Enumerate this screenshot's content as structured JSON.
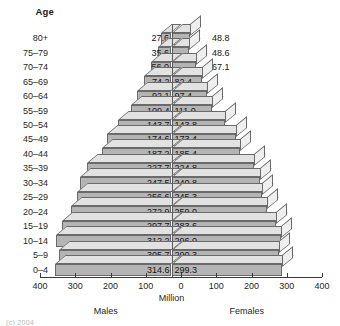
{
  "chart_data": {
    "type": "bar",
    "subtype": "population-pyramid",
    "title": "",
    "xlabel": "Million",
    "ylabel": "Age",
    "xlim": [
      -400,
      400
    ],
    "xticks": [
      400,
      300,
      200,
      100,
      0,
      100,
      200,
      300,
      400
    ],
    "grid": false,
    "categories": [
      "0–4",
      "5–9",
      "10–14",
      "15–19",
      "20–24",
      "25–29",
      "30–34",
      "35–39",
      "40–44",
      "45–49",
      "50–54",
      "55–59",
      "60–64",
      "65–69",
      "70–74",
      "75–79",
      "80+"
    ],
    "series": [
      {
        "name": "Males",
        "side": "left",
        "values": [
          314.6,
          305.7,
          312.2,
          297.7,
          272.9,
          256.6,
          247.5,
          227.7,
          187.2,
          174.6,
          143.7,
          109.4,
          92.1,
          74.2,
          56.0,
          35.6,
          27.6
        ]
      },
      {
        "name": "Females",
        "side": "right",
        "values": [
          299.3,
          290.3,
          296.0,
          283.6,
          259.0,
          245.3,
          240.8,
          224.8,
          185.4,
          173.4,
          143.8,
          111.0,
          97.4,
          82.4,
          67.1,
          48.6,
          48.8
        ]
      }
    ],
    "legend_position": "below-axis"
  },
  "header": {
    "age_label": "Age"
  },
  "axis": {
    "tick_labels": [
      "400",
      "300",
      "200",
      "100",
      "0",
      "100",
      "200",
      "300",
      "400"
    ],
    "unit_label": "Million",
    "males_label": "Males",
    "females_label": "Females"
  },
  "rows": [
    {
      "age": "80+",
      "male": "27.6",
      "female": "48.8",
      "male_inside": false,
      "female_inside": false
    },
    {
      "age": "75–79",
      "male": "35.6",
      "female": "48.6",
      "male_inside": false,
      "female_inside": false
    },
    {
      "age": "70–74",
      "male": "56.0",
      "female": "67.1",
      "male_inside": false,
      "female_inside": false
    },
    {
      "age": "65–69",
      "male": "74.2",
      "female": "82.4",
      "male_inside": true,
      "female_inside": true
    },
    {
      "age": "60–64",
      "male": "92.1",
      "female": "97.4",
      "male_inside": true,
      "female_inside": true
    },
    {
      "age": "55–59",
      "male": "109.4",
      "female": "111.0",
      "male_inside": true,
      "female_inside": true
    },
    {
      "age": "50–54",
      "male": "143.7",
      "female": "143.8",
      "male_inside": true,
      "female_inside": true
    },
    {
      "age": "45–49",
      "male": "174.6",
      "female": "173.4",
      "male_inside": true,
      "female_inside": true
    },
    {
      "age": "40–44",
      "male": "187.2",
      "female": "185.4",
      "male_inside": true,
      "female_inside": true
    },
    {
      "age": "35–39",
      "male": "227.7",
      "female": "224.8",
      "male_inside": true,
      "female_inside": true
    },
    {
      "age": "30–34",
      "male": "247.5",
      "female": "240.8",
      "male_inside": true,
      "female_inside": true
    },
    {
      "age": "25–29",
      "male": "256.6",
      "female": "245.3",
      "male_inside": true,
      "female_inside": true
    },
    {
      "age": "20–24",
      "male": "272.9",
      "female": "259.0",
      "male_inside": true,
      "female_inside": true
    },
    {
      "age": "15–19",
      "male": "297.7",
      "female": "283.6",
      "male_inside": true,
      "female_inside": true
    },
    {
      "age": "10–14",
      "male": "312.2",
      "female": "296.0",
      "male_inside": true,
      "female_inside": true
    },
    {
      "age": "5–9",
      "male": "305.7",
      "female": "290.3",
      "male_inside": true,
      "female_inside": true
    },
    {
      "age": "0–4",
      "male": "314.6",
      "female": "299.3",
      "male_inside": true,
      "female_inside": true
    }
  ],
  "footnote": {
    "text": "(c) 2004"
  },
  "colors": {
    "bar_front": "#b4b4b4",
    "bar_top": "#e2e2e2",
    "bar_side": "#efefef",
    "bar_edge": "#6a6a6a",
    "axis": "#3a3a3a",
    "text": "#1a1a1a",
    "background": "#ffffff"
  }
}
